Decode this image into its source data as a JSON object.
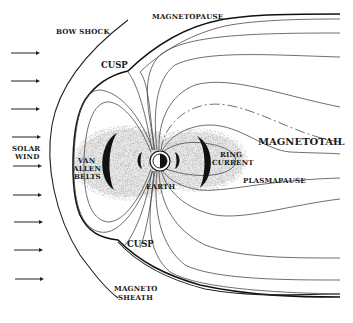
{
  "figure": {
    "labels": {
      "bow_shock": "BOW SHOCK",
      "magnetopause": "MAGNETOPAUSE",
      "cusp_north": "CUSP",
      "cusp_south": "CUSP",
      "solar_wind_1": "SOLAR",
      "solar_wind_2": "WIND",
      "van_allen_1": "VAN",
      "van_allen_2": "ALLEN",
      "van_allen_3": "BELTS",
      "earth": "EARTH",
      "ring_current_1": "RING",
      "ring_current_2": "CURRENT",
      "magnetotail": "MAGNETOTAIL",
      "plasmapause": "PLASMAPAUSE",
      "magnetosheath_1": "MAGNETO",
      "magnetosheath_2": "SHEATH"
    },
    "solar_wind_arrows": 9,
    "colors": {
      "ink": "#1a1a1a",
      "field_line": "#4a4a4a",
      "belt_shading": "#b8b8b8",
      "background": "#ffffff"
    }
  }
}
